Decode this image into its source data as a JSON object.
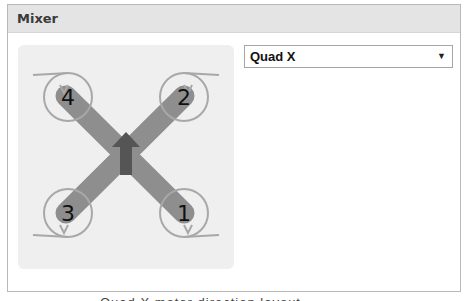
{
  "panel": {
    "title": "Mixer"
  },
  "mixer": {
    "type_select": {
      "value": "Quad X",
      "arrow": "▼"
    },
    "diagram": {
      "motors": [
        {
          "label": "1",
          "position": "rear-right"
        },
        {
          "label": "2",
          "position": "front-right"
        },
        {
          "label": "3",
          "position": "rear-left"
        },
        {
          "label": "4",
          "position": "front-left"
        }
      ],
      "direction_indicator": "arrow-up-icon"
    }
  },
  "footer": {
    "clipped_text": "Quad X motor direction layout"
  },
  "colors": {
    "header_bg": "#e4e4e4",
    "image_bg": "#efefef",
    "arm": "#8e8e8e",
    "prop_ring": "#a8a8a8",
    "arrow": "#555555"
  }
}
